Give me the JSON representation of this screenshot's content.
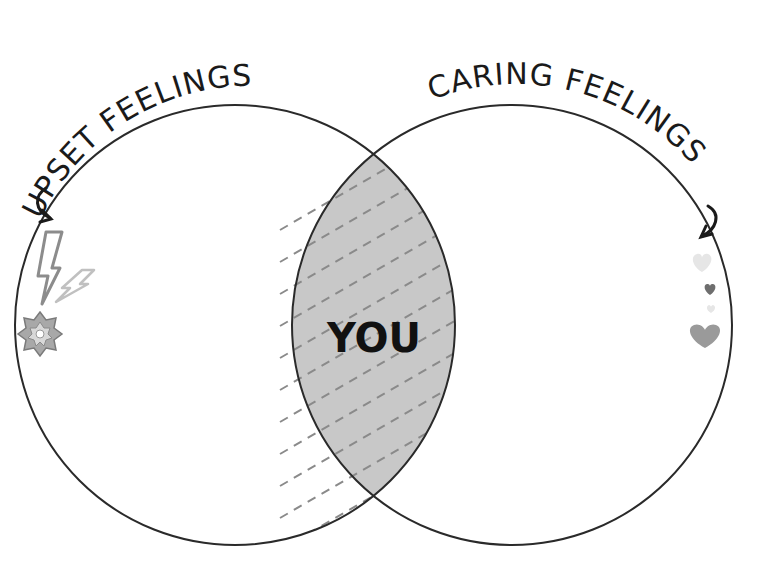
{
  "diagram": {
    "type": "venn",
    "sets": [
      {
        "id": "left",
        "label": "UPSET FEELINGS",
        "icons": [
          "lightning-bolt-large",
          "lightning-bolt-small",
          "explosion-burst"
        ]
      },
      {
        "id": "right",
        "label": "CARING FEELINGS",
        "icons": [
          "heart-light",
          "heart-dark-small",
          "heart-faint-small",
          "heart-large"
        ]
      }
    ],
    "intersection": {
      "label": "YOU",
      "fill": "#c8c8c8",
      "pattern": "dashed-diagonal"
    },
    "colors": {
      "stroke": "#2a2a2a",
      "intersection_fill": "#c8c8c8",
      "dash": "#8a8a8a",
      "icon_gray": "#9a9a9a",
      "icon_dark": "#6e6e6e",
      "icon_light": "#e2e2e2"
    }
  }
}
